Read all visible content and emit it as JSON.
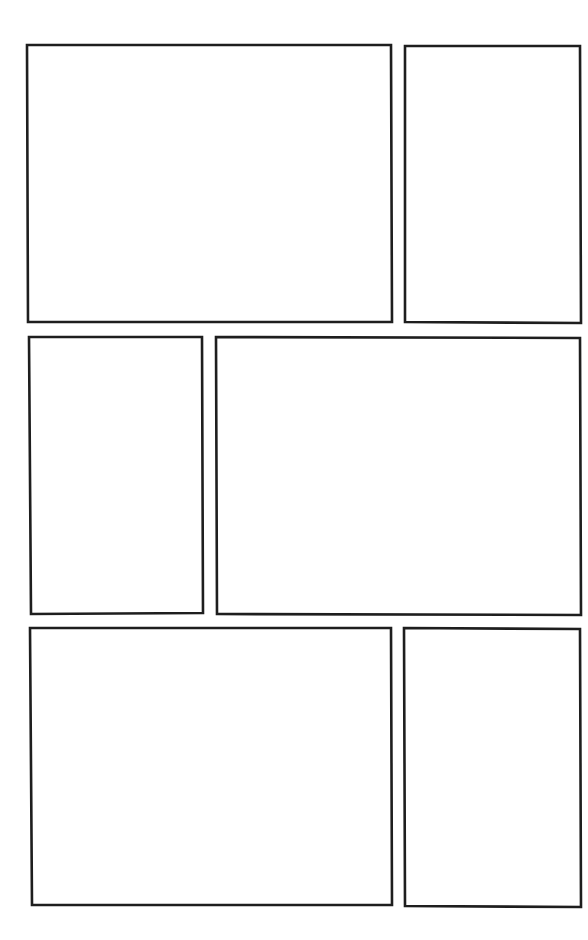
{
  "page": {
    "type": "blank comic page template",
    "background": "#ffffff",
    "border_color": "#1e1e1e",
    "panel_count": 6
  },
  "panels": [
    {
      "id": "panel-1",
      "row": 1,
      "content": "",
      "points": "27,45 391,45 392,322 28,322"
    },
    {
      "id": "panel-2",
      "row": 1,
      "content": "",
      "points": "405,46 580,46 581,323 405,322"
    },
    {
      "id": "panel-3",
      "row": 2,
      "content": "",
      "points": "29,337 202,337 203,613 31,614"
    },
    {
      "id": "panel-4",
      "row": 2,
      "content": "",
      "points": "216,337 580,338 581,615 217,614"
    },
    {
      "id": "panel-5",
      "row": 3,
      "content": "",
      "points": "30,628 391,628 392,905 32,905"
    },
    {
      "id": "panel-6",
      "row": 3,
      "content": "",
      "points": "404,628 580,629 581,907 405,906"
    }
  ]
}
